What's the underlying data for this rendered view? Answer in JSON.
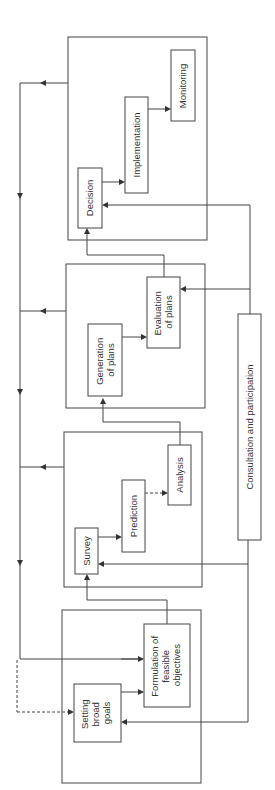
{
  "diagram": {
    "type": "planning-process-flowchart",
    "orientation": "rotated-90-ccw",
    "colors": {
      "line": "#444444",
      "text": "#333333",
      "background": "#ffffff"
    },
    "stages": [
      {
        "id": "stage-goals",
        "boxes": [
          {
            "id": "setting-goals",
            "lines": [
              "Setting",
              "broad",
              "goals"
            ]
          },
          {
            "id": "formulation",
            "lines": [
              "Formulation of",
              "feasible",
              "objectives"
            ]
          }
        ]
      },
      {
        "id": "stage-survey",
        "boxes": [
          {
            "id": "survey",
            "lines": [
              "Survey"
            ]
          },
          {
            "id": "prediction",
            "lines": [
              "Prediction"
            ]
          },
          {
            "id": "analysis",
            "lines": [
              "Analysis"
            ]
          }
        ]
      },
      {
        "id": "stage-plans",
        "boxes": [
          {
            "id": "generation",
            "lines": [
              "Generation",
              "of plans"
            ]
          },
          {
            "id": "evaluation",
            "lines": [
              "Evaluation",
              "of plans"
            ]
          }
        ]
      },
      {
        "id": "stage-decision",
        "boxes": [
          {
            "id": "decision",
            "lines": [
              "Decision"
            ]
          },
          {
            "id": "implementation",
            "lines": [
              "Implementation"
            ]
          },
          {
            "id": "monitoring",
            "lines": [
              "Monitoring"
            ]
          }
        ]
      }
    ],
    "consultation": {
      "label": "Consultation and participation"
    }
  }
}
